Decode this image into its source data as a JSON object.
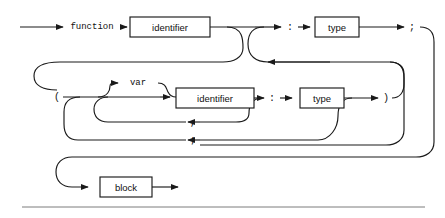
{
  "diagram": {
    "kind": "railroad-syntax-diagram",
    "title": "function",
    "stroke_color": "#1a1a1a",
    "background_color": "#ffffff",
    "rule_color": "#7c7c7c",
    "boxes": [
      {
        "id": "identifier-name",
        "label": "identifier",
        "x": 130,
        "y": 17,
        "w": 80,
        "h": 20
      },
      {
        "id": "return-type",
        "label": "type",
        "x": 315,
        "y": 17,
        "w": 44,
        "h": 20
      },
      {
        "id": "param-identifier",
        "label": "identifier",
        "x": 176,
        "y": 88,
        "w": 78,
        "h": 20
      },
      {
        "id": "param-type",
        "label": "type",
        "x": 300,
        "y": 88,
        "w": 44,
        "h": 20
      },
      {
        "id": "block",
        "label": "block",
        "x": 100,
        "y": 177,
        "w": 52,
        "h": 20
      }
    ],
    "terminals": [
      {
        "id": "kw-function",
        "label": "function",
        "x": 92,
        "y": 27
      },
      {
        "id": "kw-var",
        "label": "var",
        "x": 138,
        "y": 83
      }
    ],
    "punctuation": [
      {
        "id": "colon-return",
        "label": ":",
        "x": 290,
        "y": 27
      },
      {
        "id": "semicolon-top",
        "label": ";",
        "x": 412,
        "y": 27
      },
      {
        "id": "lparen",
        "label": "(",
        "x": 57,
        "y": 97
      },
      {
        "id": "colon-param",
        "label": ":",
        "x": 272,
        "y": 98
      },
      {
        "id": "rparen",
        "label": ")",
        "x": 386,
        "y": 98
      },
      {
        "id": "comma-param",
        "label": ",",
        "x": 193,
        "y": 122
      },
      {
        "id": "semicolon-decl",
        "label": ";",
        "x": 193,
        "y": 140
      }
    ],
    "rule": {
      "x1": 22,
      "x2": 425,
      "y": 207
    }
  }
}
